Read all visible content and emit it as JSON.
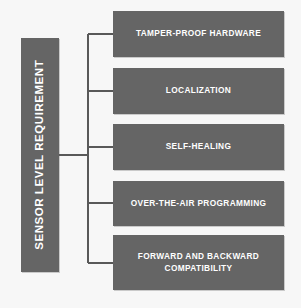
{
  "diagram": {
    "type": "bracket-hierarchy",
    "root": {
      "label": "SENSOR LEVEL REQUIREMENT",
      "orientation": "vertical-rotated",
      "fill_color": "#656565",
      "text_color": "#ffffff"
    },
    "connector": {
      "style": "bracket",
      "color": "#595959"
    },
    "background_color": "#f7f7f7",
    "leaves": [
      {
        "label": "TAMPER-PROOF HARDWARE",
        "fill_color": "#656565",
        "text_color": "#ffffff"
      },
      {
        "label": "LOCALIZATION",
        "fill_color": "#656565",
        "text_color": "#ffffff"
      },
      {
        "label": "SELF-HEALING",
        "fill_color": "#656565",
        "text_color": "#ffffff"
      },
      {
        "label": "OVER-THE-AIR PROGRAMMING",
        "fill_color": "#656565",
        "text_color": "#ffffff"
      },
      {
        "label": "FORWARD AND BACKWARD COMPATIBILITY",
        "fill_color": "#656565",
        "text_color": "#ffffff"
      }
    ]
  }
}
